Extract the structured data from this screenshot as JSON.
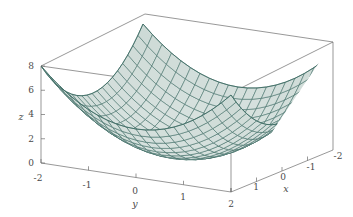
{
  "figure": {
    "kind": "3d-surface-plot",
    "background_color": "#ffffff",
    "frame_color": "#6b6b6b",
    "mesh_line_color": "#3f6d65",
    "mesh_fill_color": "#ccd9d5",
    "mesh_fill_color_light": "#dce6e3",
    "tick_label_color": "#4a4a4a"
  },
  "axes": {
    "z": {
      "title": "z",
      "ticks": [
        "0",
        "2",
        "4",
        "6",
        "8"
      ],
      "values": [
        0,
        2,
        4,
        6,
        8
      ],
      "range": [
        0,
        8
      ]
    },
    "y": {
      "title": "y",
      "ticks": [
        "-2",
        "-1",
        "0",
        "1",
        "2"
      ],
      "values": [
        -2,
        -1,
        0,
        1,
        2
      ],
      "range": [
        -2,
        2
      ]
    },
    "x": {
      "title": "x",
      "ticks": [
        "1",
        "0",
        "-1",
        "-2"
      ],
      "values": [
        1,
        0,
        -1,
        -2
      ],
      "range": [
        -2,
        2
      ]
    }
  },
  "chart_data": {
    "type": "surface",
    "title": "",
    "xlabel": "x",
    "ylabel": "y",
    "zlabel": "z",
    "function": "z = x^2 + y^2",
    "xlim": [
      -2,
      2
    ],
    "ylim": [
      -2,
      2
    ],
    "zlim": [
      0,
      8
    ],
    "grid": true,
    "legend": "none",
    "mesh_steps": 20,
    "x": [
      -2,
      -1.8,
      -1.6,
      -1.4,
      -1.2,
      -1,
      -0.8,
      -0.6,
      -0.4,
      -0.2,
      0,
      0.2,
      0.4,
      0.6,
      0.8,
      1,
      1.2,
      1.4,
      1.6,
      1.8,
      2
    ],
    "y": [
      -2,
      -1.8,
      -1.6,
      -1.4,
      -1.2,
      -1,
      -0.8,
      -0.6,
      -0.4,
      -0.2,
      0,
      0.2,
      0.4,
      0.6,
      0.8,
      1,
      1.2,
      1.4,
      1.6,
      1.8,
      2
    ],
    "z_corners": {
      "x=-2,y=-2": 8,
      "x=-2,y=2": 8,
      "x=2,y=-2": 8,
      "x=2,y=2": 8,
      "x=0,y=0": 0
    }
  }
}
